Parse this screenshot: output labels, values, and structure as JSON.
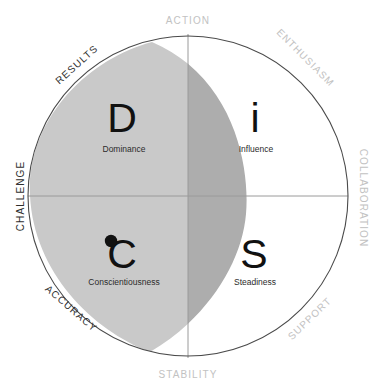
{
  "diagram": {
    "type": "quadrant-circle",
    "colors": {
      "circle_outline": "#4a4a4a",
      "axis_line": "#9a9a9a",
      "lens_light": "#c9c9c9",
      "lens_overlap": "#adadad",
      "letter": "#111111",
      "description": "#2b2b2b",
      "label_dark": "#2f2f2f",
      "label_light": "#c2c2c2",
      "background": "#ffffff"
    },
    "quadrants": [
      {
        "key": "D",
        "letter": "D",
        "description": "Dominance",
        "position": "top-left"
      },
      {
        "key": "i",
        "letter": "i",
        "description": "Influence",
        "position": "top-right"
      },
      {
        "key": "C",
        "letter": "C",
        "description": "Conscientiousness",
        "position": "bottom-left"
      },
      {
        "key": "S",
        "letter": "S",
        "description": "Steadiness",
        "position": "bottom-right"
      }
    ],
    "axis_labels": [
      {
        "text": "ACTION",
        "position": "top",
        "tone": "light"
      },
      {
        "text": "STABILITY",
        "position": "bottom",
        "tone": "light"
      },
      {
        "text": "CHALLENGE",
        "position": "left",
        "tone": "dark"
      },
      {
        "text": "COLLABORATION",
        "position": "right",
        "tone": "light"
      },
      {
        "text": "RESULTS",
        "position": "top-left",
        "tone": "dark"
      },
      {
        "text": "ENTHUSIASM",
        "position": "top-right",
        "tone": "light"
      },
      {
        "text": "ACCURACY",
        "position": "bottom-left",
        "tone": "dark"
      },
      {
        "text": "SUPPORT",
        "position": "bottom-right",
        "tone": "light"
      }
    ]
  }
}
